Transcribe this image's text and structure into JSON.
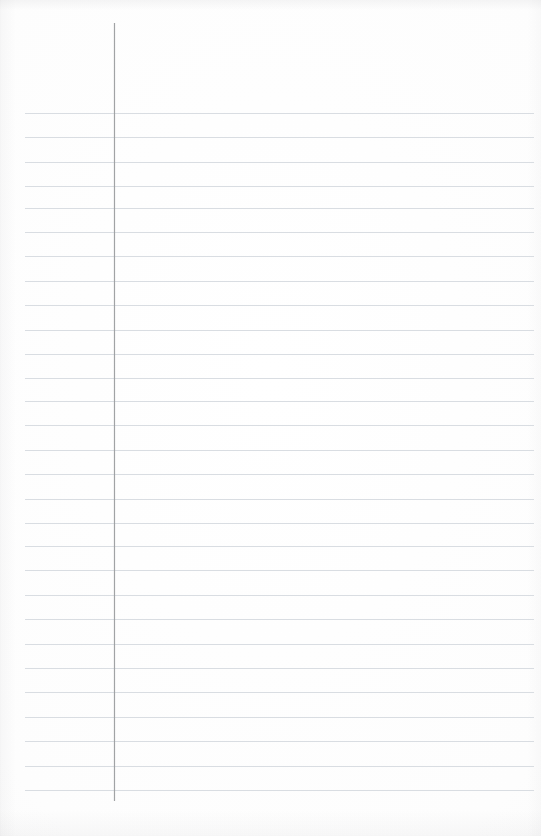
{
  "page": {
    "kind": "ruled-paper-sheet",
    "width": 541,
    "height": 836,
    "background_color": "#fdfdfc",
    "content_text": "",
    "is_blank": true
  },
  "ruling": {
    "line_color": "#d6dae0",
    "line_thickness": 1,
    "line_spacing": 24.4,
    "line_start_x": 25,
    "line_end_x": 534,
    "first_line_y": 113,
    "line_count": 29,
    "line_y_positions": [
      113,
      137.4,
      161.8,
      186.2,
      207.5,
      231.9,
      256.3,
      280.7,
      305.1,
      329.5,
      353.9,
      378.3,
      401.0,
      425.4,
      449.8,
      474.2,
      498.6,
      522.9,
      546.0,
      570.4,
      594.8,
      619.2,
      643.6,
      668.0,
      692.4,
      716.8,
      741.2,
      765.6,
      790.0
    ]
  },
  "margin": {
    "rule_color": "#9d9fa1",
    "rule_x": 114,
    "rule_top_y": 23,
    "rule_bottom_y": 801,
    "rule_thickness": 1,
    "left_gutter_width": 114
  },
  "regions": {
    "gutter_label": "left-margin-gutter",
    "writing_label": "writing-area",
    "header_label": "header-space"
  }
}
